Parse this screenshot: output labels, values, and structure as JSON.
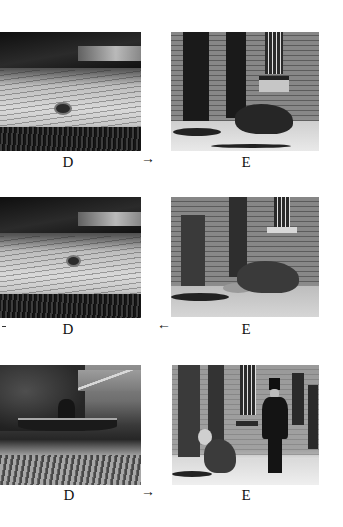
{
  "figure": {
    "rows": [
      {
        "left_label": "D",
        "right_label": "E",
        "arrow": "→",
        "arrow_direction": "right",
        "left_photo": "dog swimming in river",
        "right_photo": "dog running past brick building doorways"
      },
      {
        "left_label": "D",
        "right_label": "E",
        "arrow": "←",
        "arrow_direction": "left",
        "left_photo": "dog swimming in river",
        "right_photo": "dog walking past brick building"
      },
      {
        "left_label": "D",
        "right_label": "E",
        "arrow": "→",
        "arrow_direction": "right",
        "left_photo": "dog on boat by river bank",
        "right_photo": "dog and man in top hat outside brick building"
      }
    ]
  }
}
